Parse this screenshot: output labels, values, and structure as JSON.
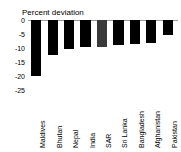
{
  "chart_data": {
    "type": "bar",
    "title": "Percent deviation",
    "xlabel": "",
    "ylabel": "",
    "categories": [
      "Maldives",
      "Bhutan",
      "Nepal",
      "India",
      "SAR",
      "Sri Lanka",
      "Bangladesh",
      "Afghanistan",
      "Pakistan"
    ],
    "values": [
      -20.0,
      -12.5,
      -10.5,
      -9.8,
      -9.5,
      -8.8,
      -8.5,
      -8.3,
      -5.3
    ],
    "ylim": [
      -25,
      0
    ],
    "yticks": [
      0,
      -5,
      -10,
      -15,
      -20,
      -25
    ],
    "ytick_labels": [
      "0",
      "-5",
      "-10",
      "-15",
      "-20",
      "-25"
    ],
    "grid": false,
    "legend": null,
    "bar_colors": [
      "#000000",
      "#000000",
      "#000000",
      "#000000",
      "#3a3a3a",
      "#000000",
      "#000000",
      "#000000",
      "#000000"
    ],
    "highlight_category": "SAR",
    "baseline_color": "#9a9a9a"
  }
}
